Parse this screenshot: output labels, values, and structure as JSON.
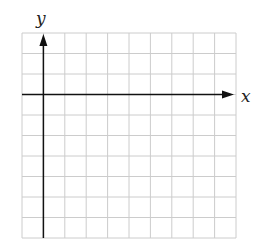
{
  "diagram": {
    "type": "coordinate-grid",
    "x_axis_label": "x",
    "y_axis_label": "y",
    "grid": {
      "columns": 10,
      "rows": 10,
      "origin_column": 1,
      "origin_row": 3,
      "line_color": "#cccccc",
      "axis_color": "#111111"
    }
  }
}
